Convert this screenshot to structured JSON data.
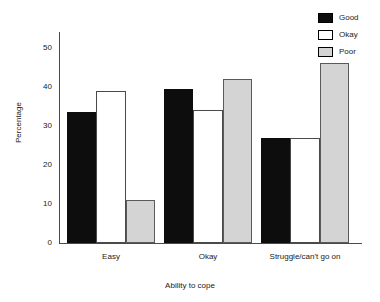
{
  "chart_data": {
    "type": "bar",
    "title": "",
    "subtitle": "",
    "xlabel": "Ability to cope",
    "ylabel": "Percentage",
    "categories": [
      "Easy",
      "Okay",
      "Struggle/can't go on"
    ],
    "series": [
      {
        "name": "Good",
        "color": "#0d0d0d",
        "values": [
          33.5,
          39.5,
          27
        ]
      },
      {
        "name": "Okay",
        "color": "#ffffff",
        "values": [
          39,
          34,
          27
        ]
      },
      {
        "name": "Poor",
        "color": "#d4d4d4",
        "values": [
          11,
          42,
          46
        ]
      }
    ],
    "ylim": [
      0,
      54
    ],
    "y_ticks": [
      0,
      10,
      20,
      30,
      40,
      50
    ],
    "y_tick_labels": [
      "0",
      "10",
      "20",
      "30",
      "40",
      "50"
    ],
    "grid": false,
    "legend_position": "top-right",
    "legend_entries": [
      "Good",
      "Okay",
      "Poor"
    ]
  }
}
